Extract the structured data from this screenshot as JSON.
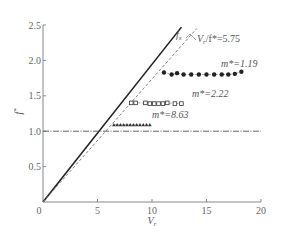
{
  "chart_data": {
    "type": "scatter",
    "title": "",
    "xlabel": "V_r",
    "ylabel": "f*",
    "xlim": [
      0,
      20
    ],
    "ylim": [
      0,
      2.5
    ],
    "xticks": [
      0,
      5,
      10,
      15,
      20
    ],
    "yticks": [
      0.5,
      1.0,
      1.5,
      2.0,
      2.5
    ],
    "xtick_labels": [
      "0",
      "5",
      "10",
      "15",
      "20"
    ],
    "ytick_labels": [
      "0.5",
      "1.0",
      "1.5",
      "2.0",
      "2.5"
    ],
    "grid": false,
    "lines": [
      {
        "name": "f_s",
        "style": "solid",
        "color": "#222222",
        "points": [
          [
            0,
            0
          ],
          [
            12.7,
            2.47
          ]
        ]
      },
      {
        "name": "V_r/f*=5.75",
        "style": "dashed",
        "color": "#777777",
        "points": [
          [
            0,
            0
          ],
          [
            14.1,
            2.45
          ]
        ]
      },
      {
        "name": "f*=1.0",
        "style": "dash-dot",
        "color": "#555555",
        "points": [
          [
            0,
            1.0
          ],
          [
            20,
            1.0
          ]
        ]
      }
    ],
    "series": [
      {
        "name": "m*=1.19",
        "marker": "circle",
        "x": [
          11.1,
          11.8,
          12.3,
          12.9,
          13.6,
          14.3,
          15.0,
          15.7,
          16.4,
          17.0,
          17.6,
          18.2
        ],
        "y": [
          1.83,
          1.8,
          1.82,
          1.8,
          1.8,
          1.8,
          1.8,
          1.8,
          1.8,
          1.8,
          1.81,
          1.84
        ]
      },
      {
        "name": "m*=2.22",
        "marker": "square",
        "x": [
          8.1,
          8.5,
          9.4,
          9.8,
          10.2,
          10.6,
          11.0,
          11.4,
          12.1,
          12.7
        ],
        "y": [
          1.4,
          1.4,
          1.4,
          1.39,
          1.39,
          1.39,
          1.39,
          1.4,
          1.39,
          1.39
        ]
      },
      {
        "name": "m*=8.63",
        "marker": "triangle",
        "x": [
          6.5,
          6.8,
          7.1,
          7.4,
          7.7,
          8.0,
          8.3,
          8.6,
          8.9,
          9.2,
          9.5,
          9.8
        ],
        "y": [
          1.09,
          1.09,
          1.09,
          1.09,
          1.09,
          1.09,
          1.09,
          1.09,
          1.09,
          1.09,
          1.09,
          1.09
        ]
      }
    ],
    "annotations": [
      {
        "text": "f_s",
        "x": 12.6,
        "y": 2.5
      },
      {
        "text": "V_r/f*=5.75",
        "x": 15.3,
        "y": 2.36
      },
      {
        "text": "m*=1.19",
        "x": 15.9,
        "y": 1.95
      },
      {
        "text": "m*=2.22",
        "x": 13.3,
        "y": 1.53
      },
      {
        "text": "m*=8.63",
        "x": 11.2,
        "y": 1.21
      }
    ]
  },
  "labels": {
    "origin": "0",
    "x_axis": "V",
    "x_axis_sub": "r",
    "y_axis": "f",
    "y_axis_sup": "*",
    "fs": "f",
    "fs_sub": "s",
    "slope_anno": "V",
    "slope_anno_sub": "r",
    "slope_anno_rest": "/f*=5.75",
    "m1": "m*=1.19",
    "m2": "m*=2.22",
    "m3": "m*=8.63"
  }
}
